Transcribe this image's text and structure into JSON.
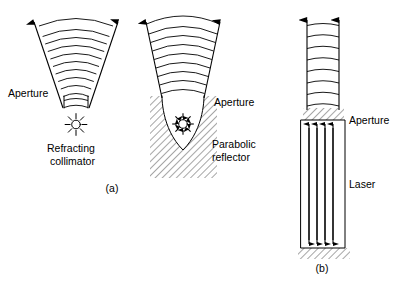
{
  "figure": {
    "background_color": "#ffffff",
    "ink_color": "#000000",
    "width": 401,
    "height": 282
  },
  "panel_a": {
    "caption": "(a)",
    "aperture_label": "Aperture",
    "refracting_collimator_label_line1": "Refracting",
    "refracting_collimator_label_line2": "collimator",
    "parabolic_reflector_label_line1": "Parabolic",
    "parabolic_reflector_label_line2": "reflector",
    "aperture_label_right": "Aperture",
    "left_device": {
      "name": "refracting-collimator",
      "wavefront_count": 11,
      "source_icon": "point-source-star-icon",
      "source_ray_count": 8,
      "ray_arrow_direction": "up-outward"
    },
    "right_device": {
      "name": "parabolic-reflector",
      "wavefront_count": 9,
      "source_icon": "point-source-star-icon",
      "source_ray_count": 8,
      "hatching": "diagonal",
      "ray_arrow_direction": "up-outward"
    }
  },
  "panel_b": {
    "caption": "(b)",
    "aperture_label": "Aperture",
    "laser_label": "Laser",
    "device": {
      "name": "laser-cavity",
      "wavefront_count": 8,
      "internal_arrow_count": 4,
      "beam_arrow_count": 2,
      "aperture_hatching": "diagonal",
      "base_hatching": "diagonal",
      "beam_arrow_direction": "up",
      "internal_arrow_direction": "down"
    }
  }
}
